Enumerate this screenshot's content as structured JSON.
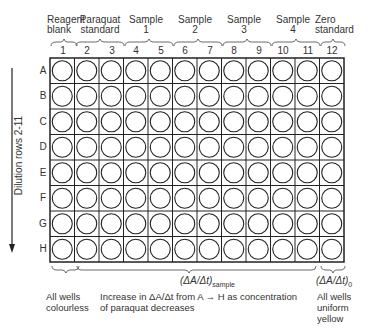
{
  "column_groups": [
    {
      "label_line1": "Reagent",
      "label_line2": "blank",
      "columns": [
        1
      ]
    },
    {
      "label_line1": "Paraquat",
      "label_line2": "standard",
      "columns": [
        2,
        3
      ]
    },
    {
      "label_line1": "Sample",
      "label_line2": "1",
      "columns": [
        4,
        5
      ]
    },
    {
      "label_line1": "Sample",
      "label_line2": "2",
      "columns": [
        6,
        7
      ]
    },
    {
      "label_line1": "Sample",
      "label_line2": "3",
      "columns": [
        8,
        9
      ]
    },
    {
      "label_line1": "Sample",
      "label_line2": "4",
      "columns": [
        10,
        11
      ]
    },
    {
      "label_line1": "Zero",
      "label_line2": "standard",
      "columns": [
        12
      ]
    }
  ],
  "columns": [
    "1",
    "2",
    "3",
    "4",
    "5",
    "6",
    "7",
    "8",
    "9",
    "10",
    "11",
    "12"
  ],
  "rows": [
    "A",
    "B",
    "C",
    "D",
    "E",
    "F",
    "G",
    "H"
  ],
  "side_label": "Dilution rows 2-11",
  "bottom": {
    "sample_rate_label": "(ΔA/Δt)",
    "sample_rate_sub": "sample",
    "zero_rate_label": "(ΔA/Δt)",
    "zero_rate_sub": "0",
    "note_left_1": "All wells",
    "note_left_2": "colourless",
    "note_mid_1": "Increase in ΔA/Δt from A → H as concentration",
    "note_mid_2": "of paraquat decreases",
    "note_right_1": "All wells",
    "note_right_2": "uniform",
    "note_right_3": "yellow"
  }
}
